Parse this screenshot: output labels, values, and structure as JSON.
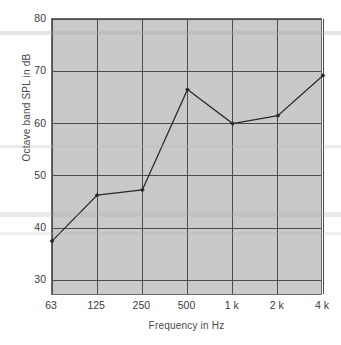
{
  "chart_data": {
    "type": "line",
    "title": "",
    "xlabel": "Frequency in Hz",
    "ylabel": "Octave band SPL in dB",
    "categories": [
      "63",
      "125",
      "250",
      "500",
      "1 k",
      "2 k",
      "4 k"
    ],
    "values": [
      37.5,
      46.3,
      47.3,
      66.5,
      60.0,
      61.5,
      69.2
    ],
    "series": [
      {
        "name": "Octave band SPL",
        "values": [
          37.5,
          46.3,
          47.3,
          66.5,
          60.0,
          61.5,
          69.2
        ]
      }
    ],
    "ylim": [
      27.0,
      80.0
    ],
    "yticks": [
      30,
      40,
      50,
      60,
      70,
      80
    ],
    "ytick_labels": [
      "30",
      "40",
      "50",
      "60",
      "70",
      "80"
    ],
    "xtick_labels": [
      "63",
      "125",
      "250",
      "500",
      "1 k",
      "2 k",
      "4 k"
    ],
    "grid": true,
    "legend": "none",
    "marker": "diamond",
    "line_color": "#2b2b2b",
    "plot_background": "#c9c9c9",
    "grid_color": "#4d4d4d",
    "text_color": "#3a3a3a"
  }
}
